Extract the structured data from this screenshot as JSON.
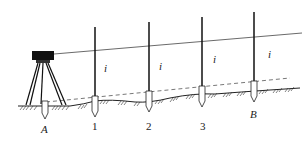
{
  "diagram": {
    "type": "leveling-survey-illustration",
    "colors": {
      "ink": "#1a1a1a",
      "background": "#ffffff",
      "sight_line": "#444444",
      "dashed_line": "#555555"
    },
    "instrument": {
      "label": ""
    },
    "points": [
      {
        "id": "A",
        "label": "A",
        "italic": true
      },
      {
        "id": "p1",
        "label": "1",
        "italic": false
      },
      {
        "id": "p2",
        "label": "2",
        "italic": false
      },
      {
        "id": "p3",
        "label": "3",
        "italic": false
      },
      {
        "id": "B",
        "label": "B",
        "italic": true
      }
    ],
    "height_labels": [
      "i",
      "i",
      "i",
      "i"
    ]
  }
}
